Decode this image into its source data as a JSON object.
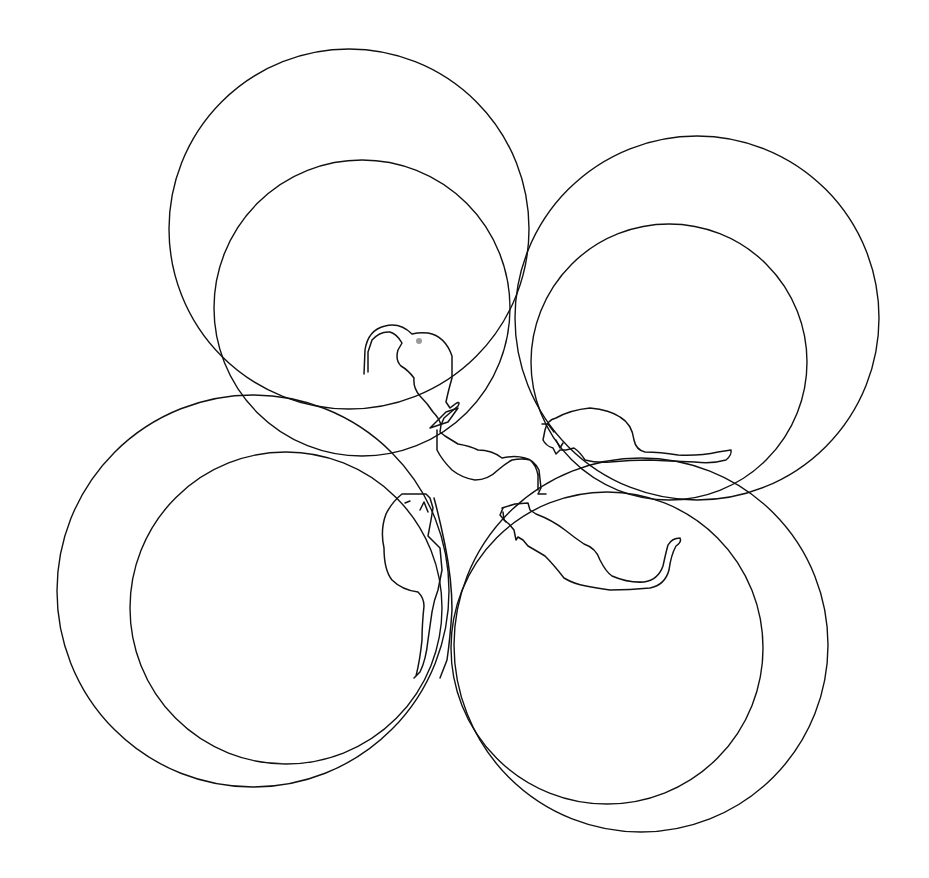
{
  "figure": {
    "width": 929,
    "height": 878,
    "stroke_color": "#111111",
    "background": "#ffffff"
  },
  "circles": [
    {
      "id": "top-left-outer",
      "cx": 349,
      "cy": 229,
      "r": 180
    },
    {
      "id": "top-left-inner",
      "cx": 362,
      "cy": 308,
      "r": 148
    },
    {
      "id": "top-right-outer",
      "cx": 697,
      "cy": 318,
      "r": 182
    },
    {
      "id": "top-right-inner",
      "cx": 669,
      "cy": 362,
      "r": 138
    },
    {
      "id": "bottom-left-outer",
      "cx": 253,
      "cy": 591,
      "r": 196
    },
    {
      "id": "bottom-left-inner",
      "cx": 286,
      "cy": 608,
      "r": 156
    },
    {
      "id": "bottom-right-outer",
      "cx": 641,
      "cy": 645,
      "r": 187
    },
    {
      "id": "bottom-right-inner",
      "cx": 607,
      "cy": 648,
      "r": 156
    }
  ],
  "mice": [
    {
      "id": "mouse-top",
      "orientation": "head-down, tail curling up-left"
    },
    {
      "id": "mouse-right",
      "orientation": "head-left, tail right"
    },
    {
      "id": "mouse-left",
      "orientation": "head-up, tail down"
    },
    {
      "id": "mouse-bottom-right",
      "orientation": "head-up-left, tail curling up-right"
    }
  ]
}
